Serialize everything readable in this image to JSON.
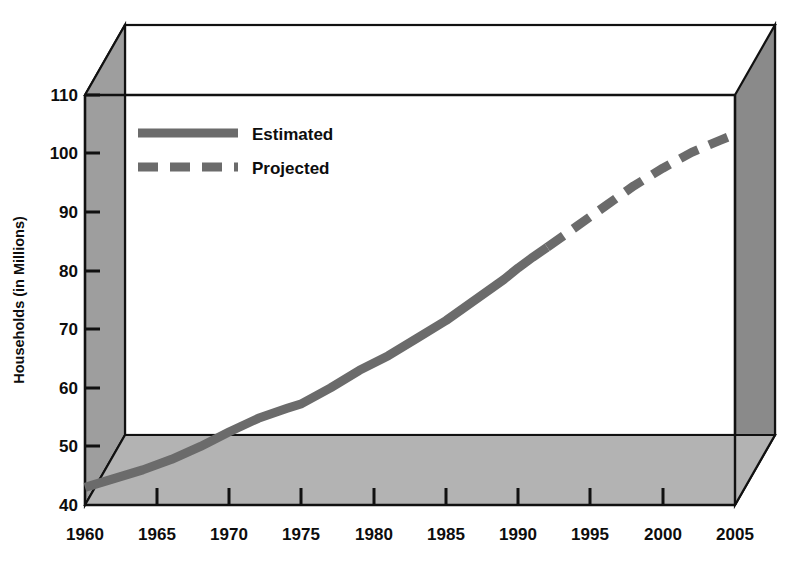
{
  "chart_data": {
    "type": "line",
    "title": "",
    "xlabel": "",
    "ylabel": "Households (in Millions)",
    "xlim": [
      1960,
      2005
    ],
    "ylim": [
      40,
      110
    ],
    "xticks": [
      "1960",
      "1965",
      "1970",
      "1975",
      "1980",
      "1985",
      "1990",
      "1995",
      "2000",
      "2005"
    ],
    "yticks": [
      "40",
      "50",
      "60",
      "70",
      "80",
      "90",
      "100",
      "110"
    ],
    "grid": false,
    "legend_position": "top-left",
    "legend": [
      {
        "name": "Estimated",
        "style": "solid",
        "color": "#6b6b6b"
      },
      {
        "name": "Projected",
        "style": "dashed",
        "color": "#6b6b6b"
      }
    ],
    "series": [
      {
        "name": "Estimated",
        "style": "solid",
        "color": "#6b6b6b",
        "x": [
          1960,
          1962,
          1964,
          1966,
          1968,
          1970,
          1972,
          1974,
          1975,
          1977,
          1979,
          1981,
          1983,
          1985,
          1987,
          1989,
          1990,
          1991,
          1992
        ],
        "values": [
          43.0,
          44.5,
          46.0,
          47.8,
          50.0,
          52.5,
          54.8,
          56.5,
          57.3,
          60.0,
          63.0,
          65.5,
          68.5,
          71.5,
          75.0,
          78.5,
          80.5,
          82.3,
          84.0
        ]
      },
      {
        "name": "Projected",
        "style": "dashed",
        "color": "#6b6b6b",
        "x": [
          1992,
          1994,
          1996,
          1998,
          2000,
          2002,
          2004,
          2005
        ],
        "values": [
          84.0,
          87.5,
          91.0,
          94.5,
          97.5,
          100.2,
          102.3,
          103.3
        ]
      }
    ]
  },
  "colors": {
    "line": "#6b6b6b",
    "top_face": "#d4d4d4",
    "left_face": "#9e9e9e",
    "right_face": "#8a8a8a",
    "floor_face": "#b3b3b3",
    "back_wall": "#ffffff",
    "outline": "#111111",
    "text": "#0d0d0d"
  }
}
